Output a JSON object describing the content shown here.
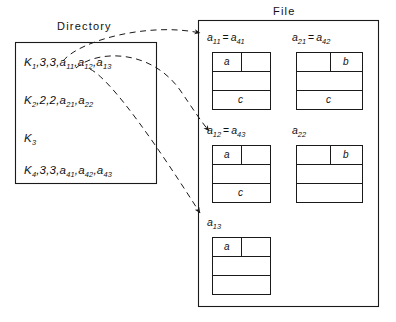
{
  "diagram": {
    "directory": {
      "title": "Directory",
      "rows": [
        {
          "key": "K",
          "key_sub": "1",
          "rest": ",3,3,",
          "items": [
            {
              "b": "a",
              "s": "11"
            },
            {
              "b": "a",
              "s": "12"
            },
            {
              "b": "a",
              "s": "13"
            }
          ]
        },
        {
          "key": "K",
          "key_sub": "2",
          "rest": ",2,2,",
          "items": [
            {
              "b": "a",
              "s": "21"
            },
            {
              "b": "a",
              "s": "22"
            }
          ]
        },
        {
          "key": "K",
          "key_sub": "3",
          "rest": "",
          "items": []
        },
        {
          "key": "K",
          "key_sub": "4",
          "rest": ",3,3,",
          "items": [
            {
              "b": "a",
              "s": "41"
            },
            {
              "b": "a",
              "s": "42"
            },
            {
              "b": "a",
              "s": "43"
            }
          ]
        }
      ]
    },
    "file": {
      "title": "File",
      "blocks": [
        {
          "name": "block-a11",
          "label": [
            {
              "b": "a",
              "s": "11"
            },
            {
              "b": "a",
              "s": "41"
            }
          ],
          "equals": "=",
          "cells": {
            "top_left": "a",
            "top_right": "",
            "middle": "",
            "bottom": "c"
          }
        },
        {
          "name": "block-a21",
          "label": [
            {
              "b": "a",
              "s": "21"
            },
            {
              "b": "a",
              "s": "42"
            }
          ],
          "equals": "=",
          "cells": {
            "top_left": "",
            "top_right": "b",
            "middle": "",
            "bottom": "c"
          }
        },
        {
          "name": "block-a12",
          "label": [
            {
              "b": "a",
              "s": "12"
            },
            {
              "b": "a",
              "s": "43"
            }
          ],
          "equals": "=",
          "cells": {
            "top_left": "a",
            "top_right": "",
            "middle": "",
            "bottom": "c"
          }
        },
        {
          "name": "block-a22",
          "label": [
            {
              "b": "a",
              "s": "22"
            }
          ],
          "equals": "",
          "cells": {
            "top_left": "",
            "top_right": "b",
            "middle": "",
            "bottom": ""
          }
        },
        {
          "name": "block-a13",
          "label": [
            {
              "b": "a",
              "s": "13"
            }
          ],
          "equals": "",
          "cells": {
            "top_left": "a",
            "top_right": "",
            "middle": "",
            "bottom": ""
          }
        }
      ]
    },
    "pointers": [
      {
        "name": "pointer-to-a11",
        "from": "directory-row-1",
        "to": "block-a11"
      },
      {
        "name": "pointer-to-a12",
        "from": "directory-row-1",
        "to": "block-a12"
      },
      {
        "name": "pointer-to-a13",
        "from": "directory-row-1",
        "to": "block-a13"
      }
    ],
    "colors": {
      "stroke": "#1a1a1a",
      "text": "#111111",
      "background": "#ffffff"
    }
  }
}
